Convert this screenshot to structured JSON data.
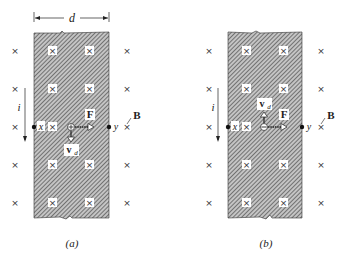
{
  "figure": {
    "panels": [
      {
        "id": "a",
        "caption": "(a)",
        "width_label": "d",
        "current_label": "i",
        "field_label": "B",
        "force_label": "F",
        "velocity_label": "v",
        "velocity_subscript": "d",
        "left_point_label": "x",
        "right_point_label": "y",
        "velocity_direction": "down",
        "force_direction": "right",
        "carrier_sign": "+"
      },
      {
        "id": "b",
        "caption": "(b)",
        "current_label": "i",
        "field_label": "B",
        "force_label": "F",
        "velocity_label": "v",
        "velocity_subscript": "d",
        "left_point_label": "x",
        "right_point_label": "y",
        "velocity_direction": "up",
        "force_direction": "right",
        "carrier_sign": "−"
      }
    ],
    "field_symbol": "×",
    "colors": {
      "ink": "#222222",
      "hatch_bg": "#bdbdbd",
      "background": "#ffffff"
    }
  }
}
